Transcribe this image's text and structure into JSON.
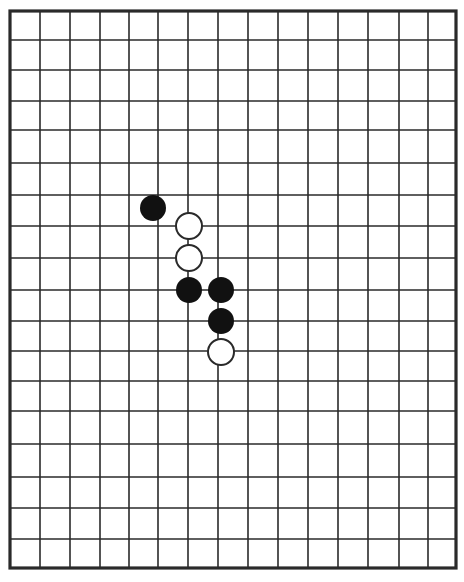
{
  "diagram": {
    "type": "go-board-fragment",
    "colors": {
      "background": "#ffffff",
      "line": "#2a2a2a",
      "black_stone": "#111111",
      "white_stone_fill": "#ffffff",
      "white_stone_stroke": "#2a2a2a"
    },
    "grid": {
      "columns_x": [
        10,
        40,
        70,
        100,
        129,
        158,
        188,
        218,
        248,
        278,
        308,
        338,
        368,
        399,
        428,
        456
      ],
      "rows_y": [
        11,
        40,
        70,
        101,
        130,
        163,
        195,
        226,
        258,
        290,
        321,
        351,
        381,
        411,
        444,
        477,
        508,
        539,
        568
      ],
      "border": {
        "left": 10,
        "right": 456,
        "top": 11,
        "bottom": 568
      }
    },
    "stones": [
      {
        "color": "black",
        "x": 153,
        "y": 208
      },
      {
        "color": "white",
        "x": 189,
        "y": 226
      },
      {
        "color": "white",
        "x": 189,
        "y": 258
      },
      {
        "color": "black",
        "x": 189,
        "y": 290
      },
      {
        "color": "black",
        "x": 221,
        "y": 290
      },
      {
        "color": "black",
        "x": 221,
        "y": 321
      },
      {
        "color": "white",
        "x": 221,
        "y": 352
      }
    ],
    "stone_radius": 13
  }
}
